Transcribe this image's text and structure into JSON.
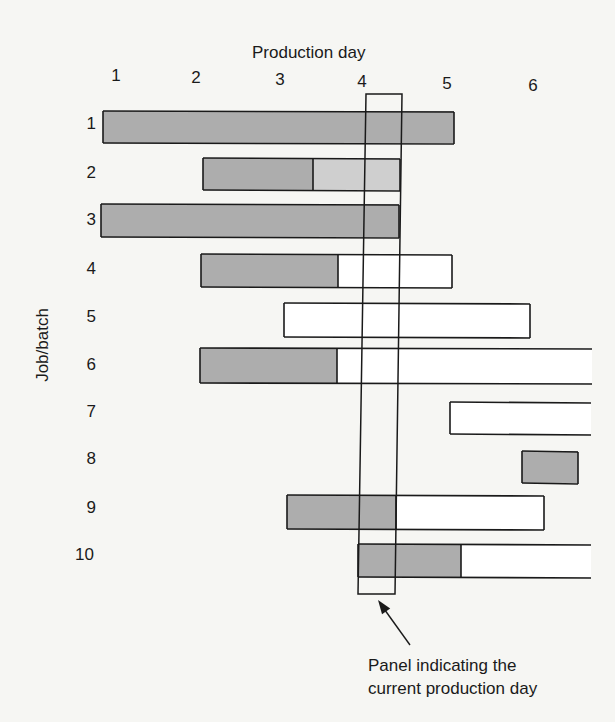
{
  "header": {
    "title": "Production day",
    "y_axis_label": "Job/batch"
  },
  "days": [
    {
      "label": "1",
      "x": 116,
      "y": 66
    },
    {
      "label": "2",
      "x": 196,
      "y": 68
    },
    {
      "label": "3",
      "x": 280,
      "y": 70
    },
    {
      "label": "4",
      "x": 362,
      "y": 72
    },
    {
      "label": "5",
      "x": 447,
      "y": 74
    },
    {
      "label": "6",
      "x": 533,
      "y": 76
    }
  ],
  "colors": {
    "background": "#f6f6f3",
    "completed": "#adadad",
    "in_progress": "#cfcfcf",
    "planned": "#ffffff",
    "outline": "#1a1a1a"
  },
  "panel": {
    "label_line1": "Panel indicating the",
    "label_line2": "current production day",
    "polygon": [
      [
        366,
        94
      ],
      [
        402,
        94
      ],
      [
        395,
        594
      ],
      [
        358,
        594
      ]
    ],
    "arrow": {
      "from": [
        410,
        645
      ],
      "to": [
        378,
        600
      ]
    },
    "label_x": 368,
    "label_y": 654
  },
  "jobs": [
    {
      "label": "1",
      "label_y": 124,
      "x1": 103,
      "x2": 454,
      "y1": 111,
      "y2": 143,
      "segments": [
        {
          "x1": 103,
          "x2": 454,
          "fill": "completed"
        }
      ],
      "open_end": false
    },
    {
      "label": "2",
      "label_y": 173,
      "x1": 203,
      "x2": 400,
      "y1": 158,
      "y2": 190,
      "segments": [
        {
          "x1": 203,
          "x2": 313,
          "fill": "completed"
        },
        {
          "x1": 313,
          "x2": 400,
          "fill": "in_progress"
        }
      ],
      "open_end": false
    },
    {
      "label": "3",
      "label_y": 220,
      "x1": 101,
      "x2": 399,
      "y1": 204,
      "y2": 237,
      "segments": [
        {
          "x1": 101,
          "x2": 399,
          "fill": "completed"
        }
      ],
      "open_end": false
    },
    {
      "label": "4",
      "label_y": 269,
      "x1": 201,
      "x2": 452,
      "y1": 254,
      "y2": 287,
      "segments": [
        {
          "x1": 201,
          "x2": 338,
          "fill": "completed"
        },
        {
          "x1": 338,
          "x2": 452,
          "fill": "planned"
        }
      ],
      "open_end": false
    },
    {
      "label": "5",
      "label_y": 317,
      "x1": 284,
      "x2": 530,
      "y1": 303,
      "y2": 337,
      "segments": [
        {
          "x1": 284,
          "x2": 530,
          "fill": "planned"
        }
      ],
      "open_end": false
    },
    {
      "label": "6",
      "label_y": 365,
      "x1": 200,
      "x2": 592,
      "y1": 348,
      "y2": 383,
      "segments": [
        {
          "x1": 200,
          "x2": 337,
          "fill": "completed"
        },
        {
          "x1": 337,
          "x2": 592,
          "fill": "planned"
        }
      ],
      "open_end": true
    },
    {
      "label": "7",
      "label_y": 412,
      "x1": 450,
      "x2": 591,
      "y1": 402,
      "y2": 434,
      "segments": [
        {
          "x1": 450,
          "x2": 591,
          "fill": "planned"
        }
      ],
      "open_end": true
    },
    {
      "label": "8",
      "label_y": 459,
      "x1": 522,
      "x2": 578,
      "y1": 451,
      "y2": 483,
      "segments": [
        {
          "x1": 522,
          "x2": 578,
          "fill": "completed"
        }
      ],
      "open_end": false
    },
    {
      "label": "9",
      "label_y": 508,
      "x1": 287,
      "x2": 544,
      "y1": 495,
      "y2": 529,
      "segments": [
        {
          "x1": 287,
          "x2": 396,
          "fill": "completed"
        },
        {
          "x1": 396,
          "x2": 544,
          "fill": "planned"
        }
      ],
      "open_end": false
    },
    {
      "label": "10",
      "label_y": 555,
      "x1": 358,
      "x2": 591,
      "y1": 544,
      "y2": 577,
      "segments": [
        {
          "x1": 358,
          "x2": 461,
          "fill": "completed"
        },
        {
          "x1": 461,
          "x2": 591,
          "fill": "planned"
        }
      ],
      "open_end": true
    }
  ],
  "chart_data": {
    "type": "gantt",
    "title": "Production day",
    "xlabel": "Production day",
    "ylabel": "Job/batch",
    "x_ticks": [
      "1",
      "2",
      "3",
      "4",
      "5",
      "6"
    ],
    "current_day": 4,
    "categories": [
      "1",
      "2",
      "3",
      "4",
      "5",
      "6",
      "7",
      "8",
      "9",
      "10"
    ],
    "series": [
      {
        "job": "1",
        "start_day": 0.8,
        "end_day": 5.1,
        "completed_until": 5.1,
        "in_progress_until": null,
        "extends_beyond_chart": false
      },
      {
        "job": "2",
        "start_day": 2.1,
        "end_day": 4.5,
        "completed_until": 3.4,
        "in_progress_until": 4.5,
        "extends_beyond_chart": false
      },
      {
        "job": "3",
        "start_day": 0.8,
        "end_day": 4.5,
        "completed_until": 4.5,
        "in_progress_until": null,
        "extends_beyond_chart": false
      },
      {
        "job": "4",
        "start_day": 2.0,
        "end_day": 5.1,
        "completed_until": 3.7,
        "in_progress_until": null,
        "extends_beyond_chart": false
      },
      {
        "job": "5",
        "start_day": 3.0,
        "end_day": 6.0,
        "completed_until": null,
        "in_progress_until": null,
        "extends_beyond_chart": false
      },
      {
        "job": "6",
        "start_day": 2.0,
        "end_day": 6.7,
        "completed_until": 3.7,
        "in_progress_until": null,
        "extends_beyond_chart": true
      },
      {
        "job": "7",
        "start_day": 5.0,
        "end_day": 6.7,
        "completed_until": null,
        "in_progress_until": null,
        "extends_beyond_chart": true
      },
      {
        "job": "8",
        "start_day": 5.9,
        "end_day": 6.5,
        "completed_until": 6.5,
        "in_progress_until": null,
        "extends_beyond_chart": false
      },
      {
        "job": "9",
        "start_day": 3.0,
        "end_day": 6.2,
        "completed_until": 4.4,
        "in_progress_until": null,
        "extends_beyond_chart": false
      },
      {
        "job": "10",
        "start_day": 3.9,
        "end_day": 6.7,
        "completed_until": 5.1,
        "in_progress_until": null,
        "extends_beyond_chart": true
      }
    ],
    "annotations": [
      "Panel indicating the current production day"
    ],
    "legend": null,
    "grid": false
  }
}
